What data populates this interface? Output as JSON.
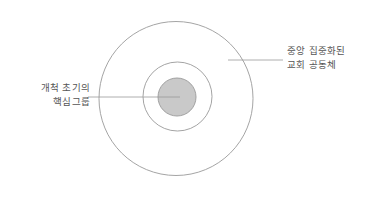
{
  "diagram": {
    "type": "concentric-circles",
    "background_color": "#ffffff",
    "stroke_color": "#9a9a9a",
    "inner_fill_color": "#c9c9c9",
    "leader_line_color": "#9a9a9a",
    "text_color": "#555555",
    "circles": [
      {
        "name": "outer-circle",
        "cx": 176,
        "cy": 98.5,
        "r": 77,
        "fill": "none",
        "stroke": "#9a9a9a"
      },
      {
        "name": "middle-circle",
        "cx": 177.5,
        "cy": 96.5,
        "r": 34.5,
        "fill": "none",
        "stroke": "#9a9a9a"
      },
      {
        "name": "inner-circle",
        "cx": 177,
        "cy": 97,
        "r": 19,
        "fill": "#c9c9c9",
        "stroke": "#9a9a9a"
      }
    ],
    "leaders": [
      {
        "name": "core-group-leader",
        "x1": 88,
        "y1": 97,
        "x2": 180,
        "y2": 97
      },
      {
        "name": "community-leader",
        "x1": 228,
        "y1": 60,
        "x2": 283,
        "y2": 60
      }
    ]
  },
  "labels": {
    "core_group": {
      "line1": "개척 초기의",
      "line2": "핵심그룹"
    },
    "community": {
      "line1": "중앙 집중화된",
      "line2": "교회 공동체"
    }
  }
}
